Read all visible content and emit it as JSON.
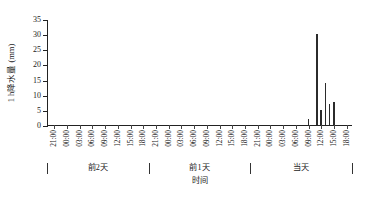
{
  "chart_data": {
    "type": "bar",
    "title": "",
    "xlabel": "时间",
    "ylabel": "1 h降水量 (mm)",
    "ylim": [
      0,
      35
    ],
    "yticks": [
      0,
      5,
      10,
      15,
      20,
      25,
      30,
      35
    ],
    "grid": false,
    "legend": null,
    "bar_color": "#2b2b2b",
    "axis_color": "#222222",
    "x_groups": [
      {
        "label": "前2天",
        "ticks": [
          "21:00",
          "00:00",
          "03:00",
          "06:00",
          "09:00",
          "12:00",
          "15:00",
          "18:00"
        ]
      },
      {
        "label": "前1天",
        "ticks": [
          "21:00",
          "00:00",
          "03:00",
          "06:00",
          "09:00",
          "12:00",
          "15:00",
          "18:00"
        ]
      },
      {
        "label": "当天",
        "ticks": [
          "21:00",
          "00:00",
          "03:00",
          "06:00",
          "09:00",
          "12:00",
          "15:00",
          "18:00"
        ]
      }
    ],
    "categories": [
      "前2天 21:00",
      "前2天 00:00",
      "前2天 03:00",
      "前2天 06:00",
      "前2天 09:00",
      "前2天 12:00",
      "前2天 15:00",
      "前2天 18:00",
      "前1天 21:00",
      "前1天 00:00",
      "前1天 03:00",
      "前1天 06:00",
      "前1天 09:00",
      "前1天 12:00",
      "前1天 15:00",
      "前1天 18:00",
      "当天 21:00",
      "当天 00:00",
      "当天 03:00",
      "当天 06:00",
      "当天 09:00",
      "当天 12:00",
      "当天 15:00",
      "当天 18:00"
    ],
    "hourly_points": [
      {
        "hour": 0,
        "value": 0
      },
      {
        "hour": 1,
        "value": 0
      },
      {
        "hour": 2,
        "value": 0
      },
      {
        "hour": 3,
        "value": 0
      },
      {
        "hour": 4,
        "value": 0
      },
      {
        "hour": 5,
        "value": 0
      },
      {
        "hour": 6,
        "value": 0
      },
      {
        "hour": 7,
        "value": 0
      },
      {
        "hour": 8,
        "value": 0
      },
      {
        "hour": 9,
        "value": 0
      },
      {
        "hour": 10,
        "value": 0
      },
      {
        "hour": 11,
        "value": 0
      },
      {
        "hour": 12,
        "value": 0
      },
      {
        "hour": 13,
        "value": 0
      },
      {
        "hour": 14,
        "value": 0
      },
      {
        "hour": 15,
        "value": 0
      },
      {
        "hour": 16,
        "value": 0
      },
      {
        "hour": 17,
        "value": 0
      },
      {
        "hour": 18,
        "value": 0
      },
      {
        "hour": 19,
        "value": 0
      },
      {
        "hour": 20,
        "value": 0
      },
      {
        "hour": 21,
        "value": 0
      },
      {
        "hour": 22,
        "value": 0
      },
      {
        "hour": 23,
        "value": 0
      },
      {
        "hour": 24,
        "value": 0
      },
      {
        "hour": 25,
        "value": 0
      },
      {
        "hour": 26,
        "value": 0
      },
      {
        "hour": 27,
        "value": 0
      },
      {
        "hour": 28,
        "value": 0
      },
      {
        "hour": 29,
        "value": 0
      },
      {
        "hour": 30,
        "value": 0
      },
      {
        "hour": 31,
        "value": 0
      },
      {
        "hour": 32,
        "value": 0
      },
      {
        "hour": 33,
        "value": 0
      },
      {
        "hour": 34,
        "value": 0
      },
      {
        "hour": 35,
        "value": 0
      },
      {
        "hour": 36,
        "value": 0
      },
      {
        "hour": 37,
        "value": 0
      },
      {
        "hour": 38,
        "value": 0
      },
      {
        "hour": 39,
        "value": 0
      },
      {
        "hour": 40,
        "value": 0
      },
      {
        "hour": 41,
        "value": 0
      },
      {
        "hour": 42,
        "value": 0
      },
      {
        "hour": 43,
        "value": 0
      },
      {
        "hour": 44,
        "value": 0
      },
      {
        "hour": 45,
        "value": 0
      },
      {
        "hour": 46,
        "value": 0
      },
      {
        "hour": 47,
        "value": 0
      },
      {
        "hour": 48,
        "value": 0
      },
      {
        "hour": 49,
        "value": 0
      },
      {
        "hour": 50,
        "value": 0
      },
      {
        "hour": 51,
        "value": 0
      },
      {
        "hour": 52,
        "value": 0
      },
      {
        "hour": 53,
        "value": 0
      },
      {
        "hour": 54,
        "value": 0
      },
      {
        "hour": 55,
        "value": 0
      },
      {
        "hour": 56,
        "value": 0
      },
      {
        "hour": 57,
        "value": 0
      },
      {
        "hour": 58,
        "value": 0
      },
      {
        "hour": 59,
        "value": 0
      },
      {
        "hour": 60,
        "value": 0
      },
      {
        "hour": 61,
        "value": 2.0
      },
      {
        "hour": 62,
        "value": 0
      },
      {
        "hour": 63,
        "value": 30.0
      },
      {
        "hour": 64,
        "value": 5.0
      },
      {
        "hour": 65,
        "value": 14.0
      },
      {
        "hour": 66,
        "value": 7.0
      },
      {
        "hour": 67,
        "value": 7.5
      },
      {
        "hour": 68,
        "value": 0
      },
      {
        "hour": 69,
        "value": 0
      },
      {
        "hour": 70,
        "value": 0
      },
      {
        "hour": 71,
        "value": 0
      }
    ]
  }
}
